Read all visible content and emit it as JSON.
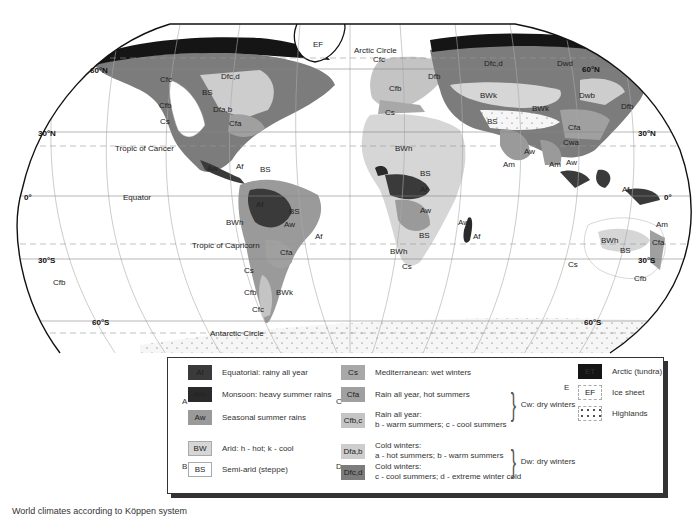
{
  "map": {
    "title": "World climates according to Köppen system",
    "parallels": {
      "lat_60n": "60°N",
      "lat_30n_left": "30°N",
      "lat_30n_right": "30°N",
      "equator_left": "0°",
      "equator_right": "0°",
      "lat_30s_left": "30°S",
      "lat_30s_right": "30°S",
      "lat_60s_left": "60°S",
      "lat_60s_right": "60°S",
      "lat_60n_right": "60°N"
    },
    "lines": {
      "arctic_circle": "Arctic Circle",
      "tropic_cancer": "Tropic of Cancer",
      "equator": "Equator",
      "tropic_capricorn": "Tropic of Capricorn",
      "antarctic_circle": "Antarctic Circle"
    },
    "region_labels": {
      "greenland": "EF",
      "na_cfc": "Cfc",
      "na_dfcd": "Dfc,d",
      "na_bs": "BS",
      "na_cfb": "Cfb",
      "na_dfab": "Dfa,b",
      "na_cs": "Cs",
      "na_bw": "BW",
      "na_cfa": "Cfa",
      "ca_aw": "Aw",
      "ca_af": "Af",
      "ca_bs": "BS",
      "sa_af": "Af",
      "sa_bs": "BS",
      "sa_aw": "Aw",
      "sa_af2": "Af",
      "sa_bwh": "BWh",
      "sa_cfa": "Cfa",
      "sa_cs": "Cs",
      "sa_cfb": "Cfb",
      "sa_bwk": "BWk",
      "sa_cfc": "Cfc",
      "nz_cfb": "Cfb",
      "eu_cfc": "Cfc",
      "eu_dfb": "Dfb",
      "eu_cfb": "Cfb",
      "eu_cs": "Cs",
      "as_dfcd": "Dfc,d",
      "as_dwd": "Dwd",
      "as_bwk1": "BWk",
      "as_bwk2": "BWk",
      "as_dwb": "Dwb",
      "as_dfb": "Dfb",
      "as_bs": "BS",
      "as_cfa": "Cfa",
      "as_cwa": "Cwa",
      "as_aw1": "Aw",
      "as_aw2": "Aw",
      "as_am1": "Am",
      "as_am2": "Am",
      "af_bwh": "BWh",
      "af_bs_n": "BS",
      "af_af": "Af",
      "af_aw": "Aw",
      "af_aw2": "Aw",
      "af_bs_s": "BS",
      "af_bwh_s": "BWh",
      "af_cs": "Cs",
      "mg_af": "Af",
      "id_af": "Af",
      "au_am": "Am",
      "au_bwh": "BWh",
      "au_bs": "BS",
      "au_cfa": "Cfa",
      "au_cs": "Cs",
      "au_cfb": "Cfb"
    }
  },
  "legend": {
    "groups": {
      "A": "A",
      "B": "B",
      "C": "C",
      "D": "D",
      "E": "E"
    },
    "items": [
      {
        "code": "Af",
        "text": "Equatorial: rainy all year",
        "color": "#3a3a3a"
      },
      {
        "code": "Am",
        "text": "Monsoon: heavy summer rains",
        "color": "#2a2a2a"
      },
      {
        "code": "Aw",
        "text": "Seasonal summer rains",
        "color": "#9a9a9a"
      },
      {
        "code": "BW",
        "text": "Arid: h - hot; k - cool",
        "color": "#d6d6d6"
      },
      {
        "code": "BS",
        "text": "Semi-arid (steppe)",
        "color": "#ffffff"
      },
      {
        "code": "Cs",
        "text": "Mediterranean: wet winters",
        "color": "#a8a8a8"
      },
      {
        "code": "Cfa",
        "text": "Rain all year, hot summers",
        "color": "#a0a0a0"
      },
      {
        "code": "Cfb,c",
        "text_line1": "Rain all year:",
        "text_line2": "b - warm summers; c - cool summers",
        "color": "#c4c4c4"
      },
      {
        "code": "Dfa,b",
        "text_line1": "Cold winters:",
        "text_line2": "a - hot summers; b - warm summers",
        "color": "#cdcdcd"
      },
      {
        "code": "Dfc,d",
        "text_line1": "Cold winters:",
        "text_line2": "c - cool summers; d - extreme winter cold",
        "color": "#7c7c7c"
      },
      {
        "code": "ET",
        "text": "Arctic (tundra)",
        "color": "#151515"
      },
      {
        "code": "EF",
        "text": "Ice sheet",
        "color": "#ffffff"
      },
      {
        "code": "",
        "text": "Highlands",
        "color": "#ffffff"
      }
    ],
    "brace_cw": "Cw: dry winters",
    "brace_dw": "Dw: dry winters"
  },
  "colors": {
    "af": "#3a3a3a",
    "am": "#2a2a2a",
    "aw": "#9a9a9a",
    "bw": "#d6d6d6",
    "bs": "#ffffff",
    "cs": "#a8a8a8",
    "cfa": "#a0a0a0",
    "cfb": "#c4c4c4",
    "dfab": "#cdcdcd",
    "dfcd": "#7c7c7c",
    "et": "#151515",
    "highland": "#f4f4f4",
    "outline": "#111111",
    "grid": "#999999"
  }
}
